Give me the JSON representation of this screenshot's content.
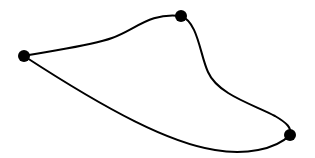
{
  "diagram": {
    "type": "closed-curve-graph",
    "background": "#ffffff",
    "stroke_color": "#000000",
    "node_color": "#000000",
    "nodes": [
      {
        "id": "left",
        "x": 24,
        "y": 56,
        "r": 6
      },
      {
        "id": "top",
        "x": 181,
        "y": 16,
        "r": 6
      },
      {
        "id": "bottom-right",
        "x": 290,
        "y": 135,
        "r": 6
      }
    ],
    "edges": [
      {
        "from": "left",
        "to": "top",
        "path": "M24,56 C60,49 90,46 112,38 C135,30 150,12 181,16"
      },
      {
        "from": "top",
        "to": "bottom-right",
        "path": "M181,16 C198,22 200,55 208,72 C218,95 255,105 275,116 C287,123 292,128 290,135"
      },
      {
        "from": "bottom-right",
        "to": "left",
        "path": "M290,135 C275,150 245,155 215,150 C170,143 110,112 24,56"
      }
    ]
  }
}
